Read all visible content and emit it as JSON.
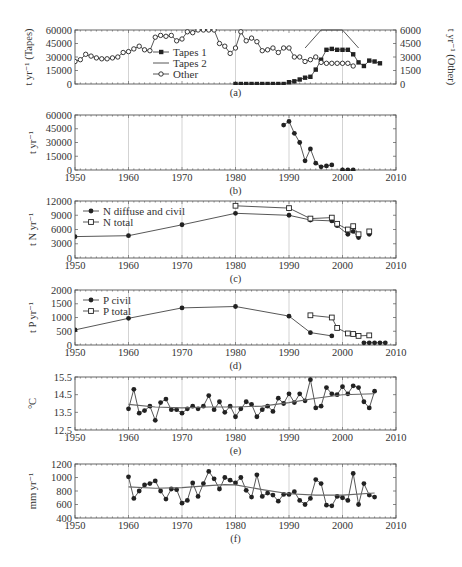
{
  "figure": {
    "panels_count": 6
  },
  "chart_data": [
    {
      "id": "a",
      "type": "line",
      "caption": "(a)",
      "ylabel": "t yr⁻¹ (Tapes)",
      "ylabel_right": "t yr⁻¹ (Other)",
      "xlim": [
        1950,
        2010
      ],
      "ylim": [
        0,
        60000
      ],
      "ylim_right": [
        0,
        6000
      ],
      "yticks": [
        0,
        15000,
        30000,
        45000,
        60000
      ],
      "yticks_right": [
        0,
        1500,
        3000,
        4500,
        6000
      ],
      "xticks": [],
      "grid_x": [
        1960,
        1980,
        2000
      ],
      "legend": {
        "position": "inside-left",
        "entries": [
          "Tapes 1",
          "Tapes 2",
          "Other"
        ]
      },
      "series": [
        {
          "name": "Tapes 1",
          "axis": "left",
          "marker": "filled-square",
          "x": [
            1980,
            1981,
            1982,
            1983,
            1984,
            1985,
            1986,
            1987,
            1988,
            1989,
            1990,
            1991,
            1992,
            1993,
            1994,
            1995,
            1996,
            1997,
            1998,
            1999,
            2000,
            2001,
            2002,
            2003,
            2004,
            2005,
            2006,
            2007
          ],
          "y": [
            0,
            0,
            0,
            0,
            0,
            0,
            0,
            0,
            0,
            0,
            2000,
            3000,
            5000,
            7000,
            8000,
            16000,
            27000,
            38000,
            39000,
            38000,
            38000,
            38000,
            33000,
            24000,
            20000,
            26000,
            25000,
            23000
          ],
          "note": "values estimated from gridlines"
        },
        {
          "name": "Tapes 2",
          "axis": "left",
          "marker": "none",
          "x": [
            1993,
            1996,
            1997,
            2000,
            2003
          ],
          "y": [
            40000,
            60000,
            60000,
            60000,
            40000
          ]
        },
        {
          "name": "Other",
          "axis": "right",
          "marker": "open-diamond",
          "x": [
            1950,
            1951,
            1952,
            1953,
            1954,
            1955,
            1956,
            1957,
            1958,
            1959,
            1960,
            1961,
            1962,
            1963,
            1964,
            1965,
            1966,
            1967,
            1968,
            1969,
            1970,
            1971,
            1972,
            1973,
            1974,
            1975,
            1976,
            1977,
            1978,
            1979,
            1980,
            1981,
            1982,
            1983,
            1984,
            1985,
            1986,
            1987,
            1988,
            1989,
            1990,
            1991,
            1992,
            1993,
            1994,
            1995,
            1996,
            1997,
            1998,
            1999,
            2000,
            2001,
            2002
          ],
          "y": [
            2500,
            2700,
            3300,
            3100,
            2900,
            2800,
            2800,
            2900,
            3000,
            3500,
            3600,
            3900,
            4200,
            3800,
            3700,
            5200,
            5400,
            5300,
            5400,
            4800,
            5000,
            5800,
            5700,
            6000,
            6000,
            6000,
            6000,
            4500,
            4200,
            3400,
            4000,
            5800,
            4800,
            5100,
            4700,
            3700,
            3800,
            4000,
            3500,
            4000,
            4000,
            3000,
            3000,
            2500,
            2700,
            3000,
            2400,
            2300,
            2300,
            2300,
            2300,
            2300,
            2000
          ]
        }
      ]
    },
    {
      "id": "b",
      "type": "line",
      "caption": "(b)",
      "ylabel": "t yr⁻¹",
      "xlim": [
        1950,
        2010
      ],
      "ylim": [
        0,
        60000
      ],
      "yticks": [
        0,
        15000,
        30000,
        45000,
        60000
      ],
      "xticks": [
        1950,
        1960,
        1970,
        1980,
        1990,
        2000,
        2010
      ],
      "grid_x": [
        1960,
        1970,
        1980,
        1990,
        2000
      ],
      "series": [
        {
          "name": "Total",
          "marker": "filled-circle",
          "x": [
            1989,
            1990,
            1991,
            1992,
            1993,
            1994,
            1995,
            1996,
            1997,
            1998,
            2000,
            2001,
            2002
          ],
          "y": [
            49000,
            53000,
            40000,
            30000,
            10000,
            23000,
            7500,
            3500,
            4500,
            5500,
            0,
            0,
            0
          ]
        }
      ]
    },
    {
      "id": "c",
      "type": "line",
      "caption": "(c)",
      "ylabel": "t N yr⁻¹",
      "xlim": [
        1950,
        2010
      ],
      "ylim": [
        0,
        12000
      ],
      "yticks": [
        0,
        3000,
        6000,
        9000,
        12000
      ],
      "xticks": [
        1950,
        1960,
        1970,
        1980,
        1990,
        2000,
        2010
      ],
      "grid_x": [
        1960,
        1970,
        1980,
        1990,
        2000
      ],
      "legend": {
        "position": "inside-top-left",
        "entries": [
          "N diffuse and civil",
          "N total"
        ]
      },
      "series": [
        {
          "name": "N diffuse and civil",
          "marker": "filled-circle",
          "x": [
            1950,
            1960,
            1970,
            1980,
            1990,
            1994,
            1998,
            1999,
            2001,
            2002,
            2003,
            2005
          ],
          "y": [
            4500,
            4700,
            7000,
            9400,
            9000,
            8000,
            7800,
            6800,
            5000,
            5600,
            4300,
            5000
          ]
        },
        {
          "name": "N total",
          "marker": "open-square",
          "x": [
            1980,
            1990,
            1994,
            1998,
            1999,
            2001,
            2002,
            2003,
            2005
          ],
          "y": [
            11000,
            10500,
            8300,
            8500,
            7200,
            6000,
            6700,
            5000,
            5600
          ]
        }
      ]
    },
    {
      "id": "d",
      "type": "line",
      "caption": "(d)",
      "ylabel": "t P yr⁻¹",
      "xlim": [
        1950,
        2010
      ],
      "ylim": [
        0,
        2000
      ],
      "yticks": [
        0,
        500,
        1000,
        1500,
        2000
      ],
      "xticks": [
        1950,
        1960,
        1970,
        1980,
        1990,
        2000,
        2010
      ],
      "grid_x": [
        1960,
        1970,
        1980,
        1990,
        2000
      ],
      "legend": {
        "position": "inside-top-left",
        "entries": [
          "P civil",
          "P total"
        ]
      },
      "series": [
        {
          "name": "P civil",
          "marker": "filled-circle",
          "x": [
            1950,
            1960,
            1970,
            1980,
            1990,
            1994,
            1998,
            2004,
            2005,
            2006,
            2007,
            2008
          ],
          "y": [
            550,
            970,
            1350,
            1400,
            1050,
            450,
            330,
            80,
            80,
            80,
            80,
            80
          ]
        },
        {
          "name": "P total",
          "marker": "open-square",
          "x": [
            1994,
            1998,
            1999,
            2001,
            2002,
            2003,
            2005
          ],
          "y": [
            1080,
            1000,
            620,
            420,
            400,
            330,
            350
          ]
        }
      ]
    },
    {
      "id": "e",
      "type": "line",
      "caption": "(e)",
      "ylabel": "°C",
      "xlim": [
        1950,
        2010
      ],
      "ylim": [
        12.5,
        15.5
      ],
      "yticks": [
        12.5,
        13.5,
        14.5,
        15.5
      ],
      "xticks": [
        1950,
        1960,
        1970,
        1980,
        1990,
        2000,
        2010
      ],
      "grid_x": [
        1960,
        1970,
        1980,
        1990,
        2000
      ],
      "series": [
        {
          "name": "Annual mean temperature",
          "marker": "filled-circle",
          "x": [
            1960,
            1961,
            1962,
            1963,
            1964,
            1965,
            1966,
            1967,
            1968,
            1969,
            1970,
            1971,
            1972,
            1973,
            1974,
            1975,
            1976,
            1977,
            1978,
            1979,
            1980,
            1981,
            1982,
            1983,
            1984,
            1985,
            1986,
            1987,
            1988,
            1989,
            1990,
            1991,
            1992,
            1993,
            1994,
            1995,
            1996,
            1997,
            1998,
            1999,
            2000,
            2001,
            2002,
            2003,
            2004,
            2005,
            2006
          ],
          "y": [
            13.7,
            14.8,
            13.45,
            13.6,
            13.85,
            13.05,
            14.05,
            14.25,
            13.65,
            13.65,
            13.45,
            13.7,
            13.85,
            13.7,
            13.85,
            14.45,
            13.65,
            14.1,
            13.5,
            13.85,
            13.25,
            13.7,
            14.1,
            13.95,
            13.25,
            13.65,
            13.85,
            13.55,
            14.3,
            14.0,
            14.55,
            14.05,
            14.55,
            14.15,
            15.35,
            13.75,
            13.85,
            14.9,
            14.55,
            14.5,
            14.95,
            14.55,
            15.0,
            14.9,
            14.1,
            13.75,
            14.7
          ]
        },
        {
          "name": "Trend",
          "marker": "none",
          "x": [
            1960,
            1965,
            1970,
            1975,
            1980,
            1985,
            1990,
            1995,
            2000,
            2006
          ],
          "y": [
            13.95,
            13.8,
            13.75,
            13.8,
            13.8,
            13.85,
            14.05,
            14.3,
            14.5,
            14.55
          ]
        }
      ]
    },
    {
      "id": "f",
      "type": "line",
      "caption": "(f)",
      "ylabel": "mm yr⁻¹",
      "xlim": [
        1950,
        2010
      ],
      "ylim": [
        400,
        1200
      ],
      "yticks": [
        400,
        600,
        800,
        1000,
        1200
      ],
      "xticks": [
        1950,
        1960,
        1970,
        1980,
        1990,
        2000,
        2010
      ],
      "grid_x": [
        1960,
        1970,
        1980,
        1990,
        2000
      ],
      "series": [
        {
          "name": "Annual precipitation",
          "marker": "filled-circle",
          "x": [
            1960,
            1961,
            1962,
            1963,
            1964,
            1965,
            1966,
            1967,
            1968,
            1969,
            1970,
            1971,
            1972,
            1973,
            1974,
            1975,
            1976,
            1977,
            1978,
            1979,
            1980,
            1981,
            1982,
            1983,
            1984,
            1985,
            1986,
            1987,
            1988,
            1989,
            1990,
            1991,
            1992,
            1993,
            1994,
            1995,
            1996,
            1997,
            1998,
            1999,
            2000,
            2001,
            2002,
            2003,
            2004,
            2005,
            2006
          ],
          "y": [
            1010,
            690,
            800,
            890,
            910,
            950,
            800,
            680,
            830,
            820,
            620,
            660,
            920,
            720,
            910,
            1090,
            980,
            830,
            1000,
            960,
            920,
            1000,
            810,
            710,
            1040,
            720,
            770,
            740,
            650,
            750,
            750,
            790,
            660,
            600,
            690,
            970,
            910,
            590,
            580,
            720,
            700,
            660,
            1060,
            600,
            910,
            740,
            710
          ]
        },
        {
          "name": "Trend",
          "marker": "none",
          "x": [
            1960,
            1965,
            1970,
            1975,
            1978,
            1980,
            1985,
            1990,
            1995,
            2000,
            2006
          ],
          "y": [
            860,
            840,
            850,
            880,
            895,
            890,
            820,
            760,
            740,
            740,
            770
          ]
        }
      ]
    }
  ],
  "layout": {
    "plot_left": 75,
    "plot_right": 396,
    "panels": {
      "a": {
        "top": 30,
        "bottom": 84
      },
      "b": {
        "top": 115,
        "bottom": 170
      },
      "c": {
        "top": 201,
        "bottom": 258
      },
      "d": {
        "top": 290,
        "bottom": 345
      },
      "e": {
        "top": 377,
        "bottom": 430
      },
      "f": {
        "top": 464,
        "bottom": 518
      }
    },
    "colors": {
      "line": "#444444",
      "marker": "#222222",
      "axis": "#555555",
      "grid": "#c8c8c8",
      "text": "#333333"
    }
  }
}
